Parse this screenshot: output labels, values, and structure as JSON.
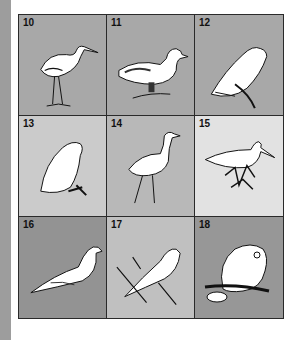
{
  "figure": {
    "cells": [
      {
        "number": "10",
        "subject": "heron",
        "bg": "#a8a8a8"
      },
      {
        "number": "11",
        "subject": "duck",
        "bg": "#a8a8a8"
      },
      {
        "number": "12",
        "subject": "falcon",
        "bg": "#a8a8a8"
      },
      {
        "number": "13",
        "subject": "ptarmigan",
        "bg": "#cbcbcb"
      },
      {
        "number": "14",
        "subject": "crane",
        "bg": "#b8b8b8"
      },
      {
        "number": "15",
        "subject": "sandpiper",
        "bg": "#e2e2e2"
      },
      {
        "number": "16",
        "subject": "dove",
        "bg": "#939393"
      },
      {
        "number": "17",
        "subject": "dove-on-branch",
        "bg": "#c0c0c0"
      },
      {
        "number": "18",
        "subject": "owl",
        "bg": "#979797"
      }
    ]
  }
}
